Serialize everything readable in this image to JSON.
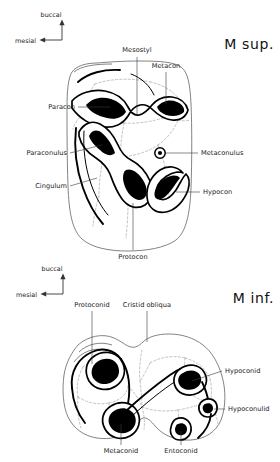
{
  "figure": {
    "background_color": "#ffffff",
    "ink_color": "#000000",
    "outline_color": "#6d6d6d",
    "fissure_color": "#a8a8a8"
  },
  "panels": [
    {
      "id": "upper",
      "title": "M sup.",
      "compass": {
        "up_label": "buccal",
        "left_label": "mesial"
      },
      "labels": [
        {
          "key": "mesostyl",
          "text": "Mesostyl"
        },
        {
          "key": "metacon",
          "text": "Metacon"
        },
        {
          "key": "paracon",
          "text": "Paracon"
        },
        {
          "key": "paraconulus",
          "text": "Paraconulus"
        },
        {
          "key": "cingulum",
          "text": "Cingulum"
        },
        {
          "key": "metaconulus",
          "text": "Metaconulus"
        },
        {
          "key": "hypocon",
          "text": "Hypocon"
        },
        {
          "key": "protocon",
          "text": "Protocon"
        }
      ]
    },
    {
      "id": "lower",
      "title": "M inf.",
      "compass": {
        "up_label": "buccal",
        "left_label": "mesial"
      },
      "labels": [
        {
          "key": "protoconid",
          "text": "Protoconid"
        },
        {
          "key": "cristid-obliqua",
          "text": "Cristid obliqua"
        },
        {
          "key": "hypoconid",
          "text": "Hypoconid"
        },
        {
          "key": "hypoconulid",
          "text": "Hypoconulid"
        },
        {
          "key": "metaconid",
          "text": "Metaconid"
        },
        {
          "key": "entoconid",
          "text": "Entoconid"
        }
      ]
    }
  ]
}
